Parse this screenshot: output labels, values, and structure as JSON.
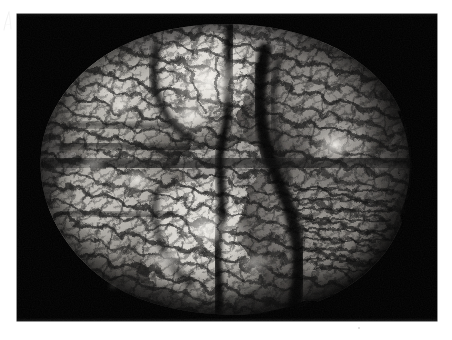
{
  "page": {
    "background_color": "#ffffff",
    "width": 452,
    "height": 340,
    "corner_mark": {
      "name": "faint-pencil-mark",
      "description": "faint light-gray handwritten slash at upper-left margin",
      "color": "#dcdcdc"
    },
    "speck": {
      "name": "page-speck",
      "color": "#d8d8d8"
    }
  },
  "photo": {
    "kind": "photograph",
    "subject": "anatomical brain specimen",
    "view": "superior / whole organ on dark background",
    "tone": "black-and-white",
    "background_color": "#010101",
    "frame": {
      "x": 17,
      "y": 14,
      "width": 420,
      "height": 307
    },
    "alt_text": "Black and white photograph of a whole brain specimen with deeply convoluted gyri on a black background",
    "palette": {
      "deep_black": "#000000",
      "shadow": "#1a1a1a",
      "mid_gray": "#6e6e6e",
      "light_gray": "#b8b8b8",
      "highlight": "#e8e6e2",
      "specular": "#f5f3ef"
    },
    "specimen": {
      "center_x": 207,
      "center_y": 152,
      "radius_x": 178,
      "radius_y": 142,
      "lobes": [
        {
          "name": "upper-left-lobe",
          "cx": 115,
          "cy": 100,
          "rx": 72,
          "ry": 62,
          "brightness": 0.72
        },
        {
          "name": "upper-middle-lobe",
          "cx": 196,
          "cy": 80,
          "rx": 66,
          "ry": 56,
          "brightness": 0.95
        },
        {
          "name": "upper-right-lobe",
          "cx": 300,
          "cy": 95,
          "rx": 78,
          "ry": 66,
          "brightness": 0.62
        },
        {
          "name": "lower-left-lobe",
          "cx": 110,
          "cy": 200,
          "rx": 74,
          "ry": 66,
          "brightness": 0.7
        },
        {
          "name": "lower-middle-lobe",
          "cx": 195,
          "cy": 225,
          "rx": 72,
          "ry": 62,
          "brightness": 0.84
        },
        {
          "name": "lower-right-lobe",
          "cx": 300,
          "cy": 210,
          "rx": 80,
          "ry": 72,
          "brightness": 0.66
        },
        {
          "name": "central-stem-region",
          "cx": 205,
          "cy": 150,
          "rx": 58,
          "ry": 34,
          "brightness": 0.45
        }
      ],
      "bright_highlights": [
        {
          "cx": 192,
          "cy": 70,
          "r": 34,
          "intensity": 0.95
        },
        {
          "cx": 176,
          "cy": 104,
          "r": 22,
          "intensity": 0.8
        },
        {
          "cx": 316,
          "cy": 132,
          "r": 17,
          "intensity": 0.88
        },
        {
          "cx": 188,
          "cy": 218,
          "r": 26,
          "intensity": 0.82
        },
        {
          "cx": 120,
          "cy": 168,
          "r": 16,
          "intensity": 0.72
        },
        {
          "cx": 108,
          "cy": 94,
          "r": 15,
          "intensity": 0.66
        }
      ],
      "dark_fissures": [
        {
          "name": "interhemispheric-fissure",
          "path": "upper-center to lower-center"
        },
        {
          "name": "right-lateral-sulcus",
          "path": "arcing right lobe"
        },
        {
          "name": "transverse-fissure",
          "path": "horizontal mid band"
        }
      ]
    }
  }
}
